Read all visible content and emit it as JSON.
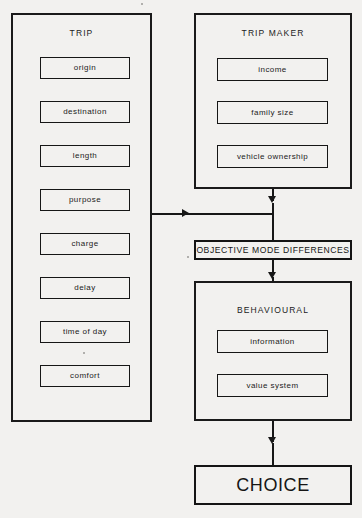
{
  "diagram": {
    "colors": {
      "background": "#f2f1ef",
      "stroke": "#171717",
      "text": "#1b1b1b"
    },
    "groups": [
      {
        "id": "trip",
        "title": "TRIP",
        "items": [
          {
            "label": "origin"
          },
          {
            "label": "destination"
          },
          {
            "label": "length"
          },
          {
            "label": "purpose"
          },
          {
            "label": "charge"
          },
          {
            "label": "delay"
          },
          {
            "label": "time of day"
          },
          {
            "label": "comfort"
          }
        ]
      },
      {
        "id": "trip-maker",
        "title": "TRIP  MAKER",
        "items": [
          {
            "label": "income"
          },
          {
            "label": "family  size"
          },
          {
            "label": "vehicle  ownership"
          }
        ]
      },
      {
        "id": "behavioural",
        "title": "BEHAVIOURAL",
        "items": [
          {
            "label": "information"
          },
          {
            "label": "value system"
          }
        ]
      }
    ],
    "nodes": [
      {
        "id": "objective-mode-differences",
        "label": "OBJECTIVE  MODE  DIFFERENCES"
      },
      {
        "id": "choice",
        "label": "CHOICE"
      }
    ]
  }
}
